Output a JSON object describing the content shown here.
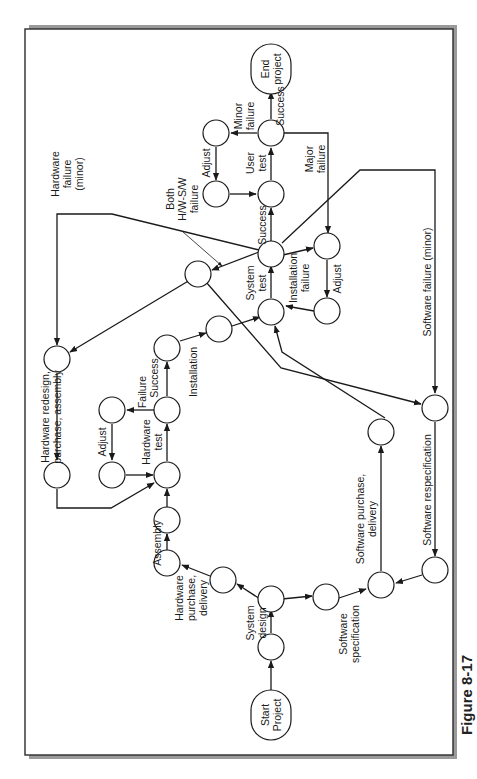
{
  "figure": {
    "caption": "Figure 8-17",
    "orientation": "rotated 90° counter-clockwise",
    "colors": {
      "ink": "#1a1a1a",
      "frame": "#2b2b2b",
      "shadow": "#8a8a8a",
      "background": "#ffffff"
    }
  },
  "terminals": {
    "start": {
      "line1": "Start",
      "line2": "Project"
    },
    "end": {
      "line1": "End",
      "line2": "project"
    }
  },
  "labels": {
    "system_design": [
      "System",
      "design"
    ],
    "hw_purchase": [
      "Hardware",
      "purchase,",
      "delivery"
    ],
    "sw_spec": [
      "Software",
      "specification"
    ],
    "assembly": "Assembly",
    "hw_test": [
      "Hardware",
      "test"
    ],
    "adjust_hw": "Adjust",
    "failure_hw": "Failure",
    "success_hw": "Success",
    "hw_redesign": [
      "Hardware redesign,",
      "purchase, assembly"
    ],
    "installation": "Installation",
    "system_test": [
      "System",
      "test"
    ],
    "installation_failure": [
      "Installation",
      "failure"
    ],
    "adjust_install": "Adjust",
    "success_system": "Success",
    "hardware_failure_minor": [
      "Hardware",
      "failure",
      "(minor)"
    ],
    "both_failure": [
      "Both",
      "H/W-S/W",
      "failure"
    ],
    "user_test": [
      "User",
      "test"
    ],
    "adjust_user": "Adjust",
    "minor_failure": [
      "Minor",
      "failure"
    ],
    "major_failure": [
      "Major",
      "failure"
    ],
    "success_user": "Success",
    "sw_purchase": [
      "Software purchase,",
      "delivery"
    ],
    "sw_respec": "Software respecification",
    "sw_failure_minor": "Software failure (minor)"
  }
}
